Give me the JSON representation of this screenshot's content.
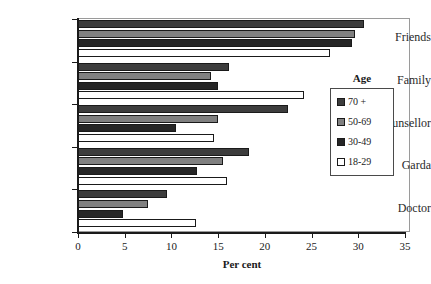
{
  "chart_data": {
    "type": "bar",
    "orientation": "horizontal",
    "title": "",
    "xlabel": "Per cent",
    "ylabel": "",
    "xlim": [
      0,
      35
    ],
    "xticks": [
      0,
      5,
      10,
      15,
      20,
      25,
      30,
      35
    ],
    "grid": false,
    "legend_title": "Age",
    "legend_position": "right-inside",
    "categories": [
      "Friends",
      "Family",
      "Counsellor",
      "Garda",
      "Doctor"
    ],
    "series": [
      {
        "name": "70 +",
        "color": "#3d3d3d",
        "values": [
          30.6,
          16.2,
          22.5,
          18.3,
          9.5
        ]
      },
      {
        "name": "50-69",
        "color": "#808080",
        "values": [
          29.6,
          14.2,
          15.0,
          15.5,
          7.5
        ]
      },
      {
        "name": "30-49",
        "color": "#262626",
        "values": [
          29.3,
          15.0,
          10.5,
          12.7,
          4.8
        ]
      },
      {
        "name": "18-29",
        "color": "#ffffff",
        "values": [
          27.0,
          24.2,
          14.6,
          16.0,
          12.6
        ]
      }
    ]
  },
  "axis": {
    "x_title": "Per cent",
    "x_tick_labels": [
      "0",
      "5",
      "10",
      "15",
      "20",
      "25",
      "30",
      "35"
    ],
    "y_tick_labels": [
      "Friends",
      "Family",
      "Counsellor",
      "Garda",
      "Doctor"
    ]
  },
  "legend": {
    "title": "Age",
    "items": [
      {
        "label": "70 +",
        "color": "#3d3d3d"
      },
      {
        "label": "50-69",
        "color": "#808080"
      },
      {
        "label": "30-49",
        "color": "#262626"
      },
      {
        "label": "18-29",
        "color": "#ffffff"
      }
    ]
  }
}
